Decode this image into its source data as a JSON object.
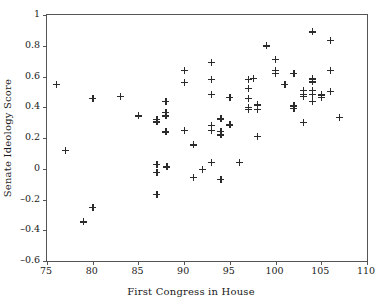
{
  "chart_data": {
    "type": "scatter",
    "title": "",
    "xlabel": "First Congress in House",
    "ylabel": "Senate Ideology Score",
    "xlim": [
      75,
      110
    ],
    "ylim": [
      -0.6,
      1
    ],
    "xticks": [
      75,
      80,
      85,
      90,
      95,
      100,
      105,
      110
    ],
    "xtick_labels": [
      "75",
      "80",
      "85",
      "90",
      "95",
      "100",
      "105",
      "110"
    ],
    "yticks": [
      1,
      0.8,
      0.6,
      0.4,
      0.2,
      0,
      -0.2,
      -0.4,
      -0.6
    ],
    "ytick_labels": [
      "1",
      "0.8",
      "0.6",
      "0.4",
      "0.2",
      "0",
      "–0.2",
      "–0.4",
      "–0.6"
    ],
    "grid": false,
    "legend": null,
    "marker": "plus",
    "marker_color": "#2b2b2b",
    "points": [
      {
        "x": 76.0,
        "y": 0.55
      },
      {
        "x": 77.0,
        "y": 0.12
      },
      {
        "x": 79.0,
        "y": -0.345
      },
      {
        "x": 80.0,
        "y": 0.46
      },
      {
        "x": 80.0,
        "y": -0.25
      },
      {
        "x": 83.0,
        "y": 0.47
      },
      {
        "x": 85.0,
        "y": 0.345
      },
      {
        "x": 87.0,
        "y": 0.32
      },
      {
        "x": 87.0,
        "y": 0.305
      },
      {
        "x": 87.0,
        "y": 0.03
      },
      {
        "x": 87.0,
        "y": -0.025
      },
      {
        "x": 87.0,
        "y": -0.165
      },
      {
        "x": 88.0,
        "y": 0.44
      },
      {
        "x": 88.0,
        "y": 0.365
      },
      {
        "x": 88.0,
        "y": 0.345
      },
      {
        "x": 88.0,
        "y": 0.24
      },
      {
        "x": 88.1,
        "y": 0.012
      },
      {
        "x": 90.0,
        "y": 0.64
      },
      {
        "x": 90.0,
        "y": 0.56
      },
      {
        "x": 90.0,
        "y": 0.25
      },
      {
        "x": 91.0,
        "y": 0.155
      },
      {
        "x": 91.0,
        "y": -0.055
      },
      {
        "x": 92.0,
        "y": -0.005
      },
      {
        "x": 93.0,
        "y": 0.69
      },
      {
        "x": 93.0,
        "y": 0.58
      },
      {
        "x": 93.0,
        "y": 0.485
      },
      {
        "x": 93.0,
        "y": 0.28
      },
      {
        "x": 93.0,
        "y": 0.25
      },
      {
        "x": 93.0,
        "y": 0.04
      },
      {
        "x": 94.0,
        "y": 0.325
      },
      {
        "x": 94.0,
        "y": 0.245
      },
      {
        "x": 94.0,
        "y": 0.22
      },
      {
        "x": 94.0,
        "y": -0.07
      },
      {
        "x": 95.0,
        "y": 0.465
      },
      {
        "x": 95.0,
        "y": 0.285
      },
      {
        "x": 96.0,
        "y": 0.04
      },
      {
        "x": 97.0,
        "y": 0.58
      },
      {
        "x": 97.0,
        "y": 0.525
      },
      {
        "x": 97.0,
        "y": 0.46
      },
      {
        "x": 97.0,
        "y": 0.4
      },
      {
        "x": 97.0,
        "y": 0.385
      },
      {
        "x": 97.6,
        "y": 0.59
      },
      {
        "x": 98.0,
        "y": 0.415
      },
      {
        "x": 98.0,
        "y": 0.385
      },
      {
        "x": 98.0,
        "y": 0.21
      },
      {
        "x": 99.0,
        "y": 0.8
      },
      {
        "x": 100.0,
        "y": 0.71
      },
      {
        "x": 100.0,
        "y": 0.64
      },
      {
        "x": 100.0,
        "y": 0.62
      },
      {
        "x": 101.0,
        "y": 0.55
      },
      {
        "x": 102.0,
        "y": 0.62
      },
      {
        "x": 102.0,
        "y": 0.41
      },
      {
        "x": 102.0,
        "y": 0.395
      },
      {
        "x": 103.0,
        "y": 0.51
      },
      {
        "x": 103.0,
        "y": 0.485
      },
      {
        "x": 103.0,
        "y": 0.47
      },
      {
        "x": 103.0,
        "y": 0.3
      },
      {
        "x": 104.0,
        "y": 0.89
      },
      {
        "x": 104.0,
        "y": 0.585
      },
      {
        "x": 104.0,
        "y": 0.565
      },
      {
        "x": 104.0,
        "y": 0.51
      },
      {
        "x": 104.0,
        "y": 0.485
      },
      {
        "x": 104.0,
        "y": 0.44
      },
      {
        "x": 105.0,
        "y": 0.48
      },
      {
        "x": 105.0,
        "y": 0.465
      },
      {
        "x": 106.0,
        "y": 0.835
      },
      {
        "x": 106.0,
        "y": 0.64
      },
      {
        "x": 106.0,
        "y": 0.505
      },
      {
        "x": 107.0,
        "y": 0.335
      }
    ]
  }
}
